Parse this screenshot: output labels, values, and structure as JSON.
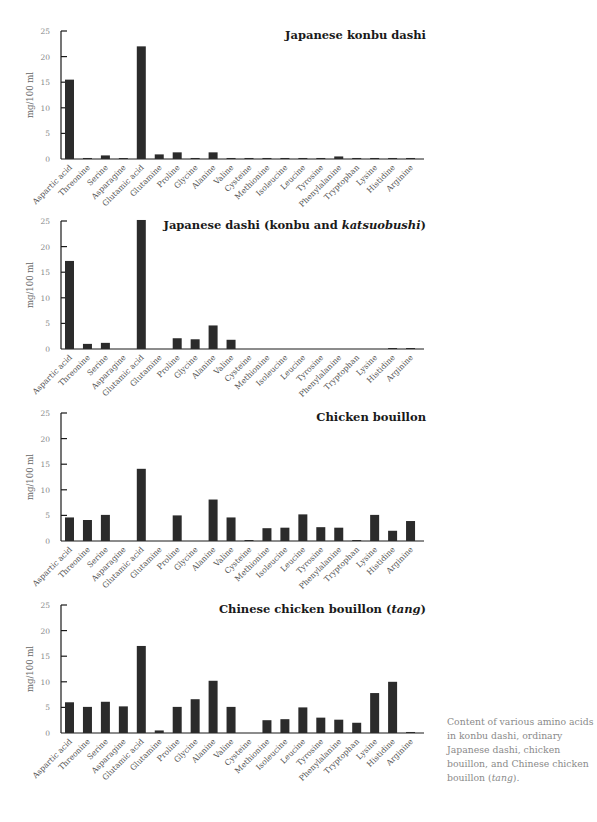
{
  "figure": {
    "caption_parts": [
      "Content of various amino acids in konbu dashi, ordinary Japanese dashi, chicken bouillon, and Chinese chicken bouillon (",
      "tang",
      ")."
    ],
    "colors": {
      "bar": "#2b2b2b",
      "axis": "#1a1a1a",
      "tick_text": "#888888",
      "caption": "#8a8a8a"
    }
  },
  "chart_data": [
    {
      "type": "bar",
      "title": "Japanese konbu dashi",
      "title_parts": [
        {
          "text": "Japanese konbu dashi",
          "italic": false
        }
      ],
      "xlabel": "",
      "ylabel": "mg/100 ml",
      "ylim": [
        0,
        25
      ],
      "yticks": [
        0,
        5,
        10,
        15,
        20,
        25
      ],
      "grid": false,
      "categories": [
        "Aspartic acid",
        "Threonine",
        "Serine",
        "Asparagine",
        "Glutamic acid",
        "Glutamine",
        "Proline",
        "Glycine",
        "Alanine",
        "Valine",
        "Cysteine",
        "Methionine",
        "Isoleucine",
        "Leucine",
        "Tyrosine",
        "Phenylalanine",
        "Tryptophan",
        "Lysine",
        "Histidine",
        "Arginine"
      ],
      "values": [
        15.5,
        0.2,
        0.7,
        0.1,
        22.0,
        0.9,
        1.3,
        0.2,
        1.3,
        0.2,
        0.2,
        0.2,
        0.2,
        0.2,
        0.2,
        0.5,
        0.2,
        0.2,
        0.2,
        0.2
      ]
    },
    {
      "type": "bar",
      "title": "Japanese dashi (konbu and katsuobushi)",
      "title_parts": [
        {
          "text": "Japanese dashi (konbu and ",
          "italic": false
        },
        {
          "text": "katsuobushi",
          "italic": true
        },
        {
          "text": ")",
          "italic": false
        }
      ],
      "xlabel": "",
      "ylabel": "mg/100 ml",
      "ylim": [
        0,
        25
      ],
      "yticks": [
        0,
        5,
        10,
        15,
        20,
        25
      ],
      "grid": false,
      "categories": [
        "Aspartic acid",
        "Threonine",
        "Serine",
        "Asparagine",
        "Glutamic acid",
        "Glutamine",
        "Proline",
        "Glycine",
        "Alanine",
        "Valine",
        "Cysteine",
        "Methionine",
        "Isoleucine",
        "Leucine",
        "Tyrosine",
        "Phenylalanine",
        "Tryptophan",
        "Lysine",
        "Histidine",
        "Arginine"
      ],
      "values": [
        17.2,
        1.0,
        1.2,
        0.0,
        25.2,
        0.0,
        2.1,
        1.9,
        4.6,
        1.8,
        0.0,
        0.0,
        0.0,
        0.0,
        0.0,
        0.0,
        0.0,
        0.0,
        0.1,
        0.1
      ]
    },
    {
      "type": "bar",
      "title": "Chicken bouillon",
      "title_parts": [
        {
          "text": "Chicken bouillon",
          "italic": false
        }
      ],
      "xlabel": "",
      "ylabel": "mg/100 ml",
      "ylim": [
        0,
        25
      ],
      "yticks": [
        0,
        5,
        10,
        15,
        20,
        25
      ],
      "grid": false,
      "categories": [
        "Aspartic acid",
        "Threonine",
        "Serine",
        "Asparagine",
        "Glutamic acid",
        "Glutamine",
        "Proline",
        "Glycine",
        "Alanine",
        "Valine",
        "Cysteine",
        "Methionine",
        "Isoleucine",
        "Leucine",
        "Tyrosine",
        "Phenylalanine",
        "Tryptophan",
        "Lysine",
        "Histidine",
        "Arginine"
      ],
      "values": [
        4.6,
        4.1,
        5.1,
        0.0,
        14.1,
        0.0,
        5.0,
        0.0,
        8.1,
        4.6,
        0.1,
        2.5,
        2.6,
        5.2,
        2.7,
        2.6,
        0.1,
        5.1,
        2.0,
        3.9
      ]
    },
    {
      "type": "bar",
      "title": "Chinese chicken bouillon (tang)",
      "title_parts": [
        {
          "text": "Chinese chicken bouillon (",
          "italic": false
        },
        {
          "text": "tang",
          "italic": true
        },
        {
          "text": ")",
          "italic": false
        }
      ],
      "xlabel": "",
      "ylabel": "mg/100 ml",
      "ylim": [
        0,
        25
      ],
      "yticks": [
        0,
        5,
        10,
        15,
        20,
        25
      ],
      "grid": false,
      "categories": [
        "Aspartic acid",
        "Threonine",
        "Serine",
        "Asparagine",
        "Glutamic acid",
        "Glutamine",
        "Proline",
        "Glycine",
        "Alanine",
        "Valine",
        "Cysteine",
        "Methionine",
        "Isoleucine",
        "Leucine",
        "Tyrosine",
        "Phenylalanine",
        "Tryptophan",
        "Lysine",
        "Histidine",
        "Arginine"
      ],
      "values": [
        6.0,
        5.1,
        6.1,
        5.2,
        17.0,
        0.5,
        5.1,
        6.6,
        10.2,
        5.1,
        0.0,
        2.5,
        2.7,
        5.0,
        3.0,
        2.6,
        2.0,
        7.8,
        10.0,
        0.2
      ]
    }
  ]
}
